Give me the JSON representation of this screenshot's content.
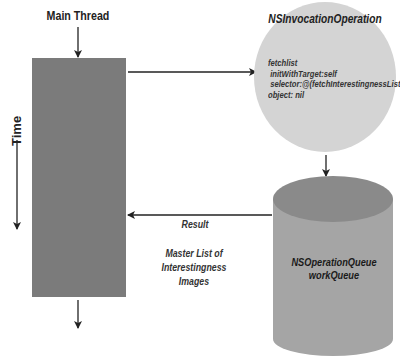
{
  "diagram": {
    "main_thread": {
      "label": "Main Thread",
      "color": "#7b7b7b"
    },
    "time_axis": {
      "label": "Time"
    },
    "invocation_operation": {
      "title": "NSInvocationOperation",
      "code_lines": [
        "fetchlist",
        " initWithTarget:self",
        " selector:@(fetchInterestingnessList",
        "object: nil"
      ],
      "color": "#d4d4d4"
    },
    "operation_queue": {
      "title": "NSOperationQueue",
      "subtitle": "workQueue",
      "color": "#a5a5a5"
    },
    "result_arrow": {
      "label": "Result"
    },
    "result_description": {
      "lines": [
        "Master List of",
        "Interestingness",
        "Images"
      ]
    }
  }
}
